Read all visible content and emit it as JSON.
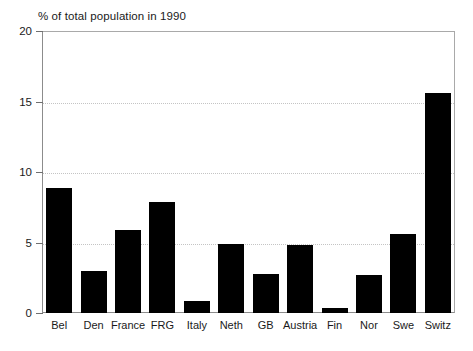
{
  "chart_data": {
    "type": "bar",
    "title": "% of total population in 1990",
    "xlabel": "",
    "ylabel": "",
    "ylim": [
      0,
      20
    ],
    "yticks": [
      0,
      5,
      10,
      15,
      20
    ],
    "ytick_labels": [
      "0",
      "5",
      "10",
      "15",
      "20"
    ],
    "grid": true,
    "grid_axis": "y",
    "legend": "none",
    "bar_color": "#000000",
    "categories": [
      "Bel",
      "Den",
      "France",
      "FRG",
      "Italy",
      "Neth",
      "GB",
      "Austria",
      "Fin",
      "Nor",
      "Swe",
      "Switz"
    ],
    "values": [
      8.9,
      3.0,
      5.9,
      7.9,
      0.85,
      4.9,
      2.8,
      4.8,
      0.35,
      2.7,
      5.6,
      15.6
    ]
  }
}
